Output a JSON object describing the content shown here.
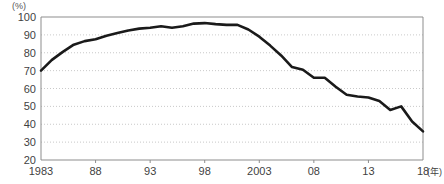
{
  "chart": {
    "unit_label": "(%)",
    "x_axis_unit": "(年)"
  },
  "chart_data": {
    "type": "line",
    "title": "",
    "subtitle": "",
    "xlabel": "(年)",
    "ylabel": "(%)",
    "xlim": [
      1983,
      2018
    ],
    "ylim": [
      20,
      100
    ],
    "grid": true,
    "legend": false,
    "legend_position": "none",
    "y_ticks": [
      20,
      30,
      40,
      50,
      60,
      70,
      80,
      90,
      100
    ],
    "y_tick_labels": [
      "20",
      "30",
      "40",
      "50",
      "60",
      "70",
      "80",
      "90",
      "100"
    ],
    "x_ticks": [
      1983,
      1988,
      1993,
      1998,
      2003,
      2008,
      2013,
      2018
    ],
    "x_tick_labels": [
      "1983",
      "88",
      "93",
      "98",
      "2003",
      "08",
      "13",
      "18"
    ],
    "line_color": "#1a1a1a",
    "line_width": 2.6,
    "x": [
      1983,
      1984,
      1985,
      1986,
      1987,
      1988,
      1989,
      1990,
      1991,
      1992,
      1993,
      1994,
      1995,
      1996,
      1997,
      1998,
      1999,
      2000,
      2001,
      2002,
      2003,
      2004,
      2005,
      2006,
      2007,
      2008,
      2009,
      2010,
      2011,
      2012,
      2013,
      2014,
      2015,
      2016,
      2017,
      2018
    ],
    "values": [
      70,
      76,
      80,
      84,
      87,
      88,
      90,
      91.5,
      93,
      94,
      94.5,
      95,
      94,
      94.5,
      96,
      96.5,
      96,
      95.5,
      95.5,
      93,
      89,
      84,
      78,
      72,
      70,
      66,
      66,
      62,
      57,
      56,
      55.5,
      54,
      50,
      52,
      45,
      43
    ],
    "series": [
      {
        "name": "値",
        "values": [
          70,
          76,
          80,
          84,
          87,
          88,
          90,
          91.5,
          93,
          94,
          94.5,
          95,
          94,
          94.5,
          96,
          96.5,
          96,
          95.5,
          95.5,
          93,
          89,
          84,
          78,
          72,
          70,
          66,
          66,
          62,
          57,
          56,
          55.5,
          54,
          50,
          52,
          45,
          43
        ]
      }
    ],
    "points": [
      [
        1983,
        70.0
      ],
      [
        1984,
        76.0
      ],
      [
        1985,
        80.5
      ],
      [
        1986,
        84.5
      ],
      [
        1987,
        86.5
      ],
      [
        1988,
        87.5
      ],
      [
        1989,
        89.5
      ],
      [
        1990,
        91.0
      ],
      [
        1991,
        92.5
      ],
      [
        1992,
        93.5
      ],
      [
        1993,
        94.0
      ],
      [
        1994,
        94.8
      ],
      [
        1995,
        94.0
      ],
      [
        1996,
        94.8
      ],
      [
        1997,
        96.3
      ],
      [
        1998,
        96.6
      ],
      [
        1999,
        96.0
      ],
      [
        2000,
        95.6
      ],
      [
        2001,
        95.6
      ],
      [
        2002,
        93.0
      ],
      [
        2003,
        89.0
      ],
      [
        2004,
        84.0
      ],
      [
        2005,
        78.5
      ],
      [
        2006,
        72.0
      ],
      [
        2007,
        70.5
      ],
      [
        2008,
        66.0
      ],
      [
        2009,
        66.0
      ],
      [
        2010,
        61.0
      ],
      [
        2011,
        56.5
      ],
      [
        2012,
        55.5
      ],
      [
        2013,
        55.0
      ],
      [
        2014,
        53.0
      ],
      [
        2015,
        48.0
      ],
      [
        2016,
        50.0
      ],
      [
        2017,
        41.5
      ],
      [
        2018,
        36.0
      ]
    ]
  }
}
